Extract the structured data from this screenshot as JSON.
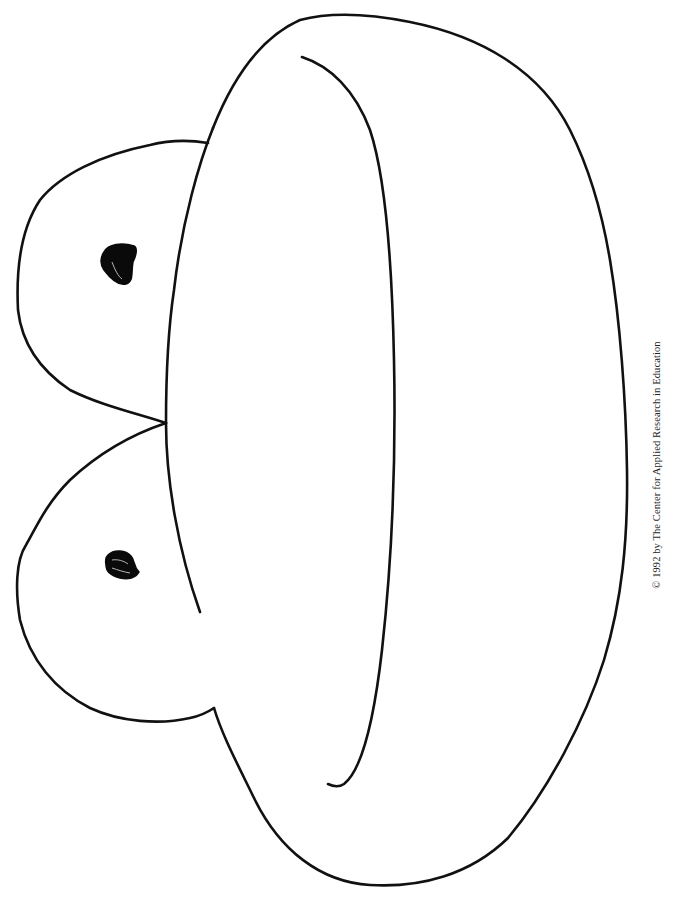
{
  "page": {
    "type": "coloring-page",
    "background_color": "#ffffff",
    "line_color": "#111111"
  },
  "drawing": {
    "parts": [
      {
        "name": "frog-body",
        "description": "large oval body outline"
      },
      {
        "name": "frog-inner-curve",
        "description": "inner curved line along body"
      },
      {
        "name": "frog-upper-eye-bulge",
        "description": "upper eye bulge outline"
      },
      {
        "name": "frog-lower-eye-bulge",
        "description": "lower eye bulge outline"
      },
      {
        "name": "frog-upper-pupil",
        "description": "filled black pupil"
      },
      {
        "name": "frog-lower-pupil",
        "description": "filled black pupil"
      }
    ]
  },
  "footer": {
    "copyright": "© 1992 by The Center for Applied Research in Education"
  }
}
